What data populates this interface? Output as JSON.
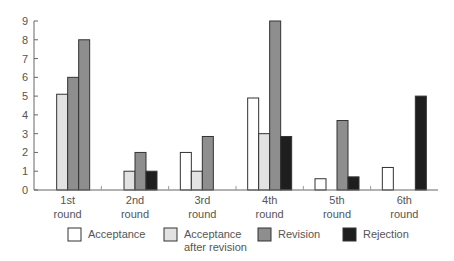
{
  "chart_data": {
    "type": "bar",
    "title": "",
    "xlabel": "",
    "ylabel": "",
    "ylim": [
      0,
      9
    ],
    "yticks": [
      0,
      1,
      2,
      3,
      4,
      5,
      6,
      7,
      8,
      9
    ],
    "grid": false,
    "legend_position": "bottom",
    "categories": [
      "1st round",
      "2nd round",
      "3rd round",
      "4th round",
      "5th round",
      "6th round"
    ],
    "category_lines": [
      [
        "1st",
        "round"
      ],
      [
        "2nd",
        "round"
      ],
      [
        "3rd",
        "round"
      ],
      [
        "4th",
        "round"
      ],
      [
        "5th",
        "round"
      ],
      [
        "6th",
        "round"
      ]
    ],
    "series": [
      {
        "name": "Acceptance",
        "legend_lines": [
          "Acceptance"
        ],
        "color": "#ffffff",
        "values": [
          0,
          0,
          2,
          4.9,
          0.6,
          1.2
        ]
      },
      {
        "name": "Acceptance after revision",
        "legend_lines": [
          "Acceptance",
          "after revision"
        ],
        "color": "#e2e2e2",
        "values": [
          5.1,
          1,
          1,
          3,
          0,
          0
        ]
      },
      {
        "name": "Revision",
        "legend_lines": [
          "Revision"
        ],
        "color": "#8e8e8e",
        "values": [
          6,
          2,
          2.85,
          9,
          3.7,
          0
        ]
      },
      {
        "name": "Rejection",
        "legend_lines": [
          "Rejection"
        ],
        "color": "#1e1e1e",
        "values": [
          8,
          1,
          0,
          2.85,
          0.7,
          5
        ]
      }
    ],
    "color_overrides": [
      {
        "series": 3,
        "category": 0,
        "color": "#8e8e8e"
      }
    ]
  }
}
